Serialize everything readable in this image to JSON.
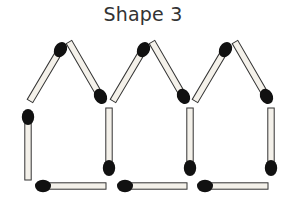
{
  "title": "Shape 3",
  "colors": {
    "stick_fill": "#f4f1ea",
    "stick_stroke": "#333333",
    "head": "#111111",
    "title": "#333333"
  },
  "diagram": {
    "type": "matchstick-puzzle",
    "houses": 3,
    "matches": [
      {
        "name": "house1-roof-left",
        "head": [
          62,
          47
        ],
        "tail": [
          30,
          101
        ]
      },
      {
        "name": "house1-roof-right",
        "head": [
          102,
          99
        ],
        "tail": [
          69,
          42
        ]
      },
      {
        "name": "house1-wall-left",
        "head": [
          28,
          114
        ],
        "tail": [
          28,
          180
        ]
      },
      {
        "name": "house1-floor",
        "head": [
          40,
          186
        ],
        "tail": [
          106,
          186
        ]
      },
      {
        "name": "house1-wall-right",
        "head": [
          109,
          171
        ],
        "tail": [
          109,
          108
        ]
      },
      {
        "name": "house2-roof-left",
        "head": [
          145,
          47
        ],
        "tail": [
          113,
          101
        ]
      },
      {
        "name": "house2-roof-right",
        "head": [
          185,
          99
        ],
        "tail": [
          152,
          42
        ]
      },
      {
        "name": "house2-floor",
        "head": [
          122,
          186
        ],
        "tail": [
          187,
          186
        ]
      },
      {
        "name": "house2-wall-right",
        "head": [
          190,
          171
        ],
        "tail": [
          190,
          108
        ]
      },
      {
        "name": "house3-roof-left",
        "head": [
          227,
          47
        ],
        "tail": [
          195,
          101
        ]
      },
      {
        "name": "house3-roof-right",
        "head": [
          268,
          99
        ],
        "tail": [
          235,
          42
        ]
      },
      {
        "name": "house3-floor",
        "head": [
          202,
          186
        ],
        "tail": [
          268,
          186
        ]
      },
      {
        "name": "house3-wall-right",
        "head": [
          271,
          171
        ],
        "tail": [
          271,
          108
        ]
      }
    ],
    "match_count": 13
  }
}
